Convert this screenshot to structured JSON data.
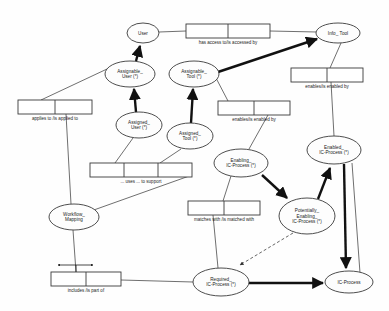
{
  "diagram": {
    "type": "entity-relationship-fact-diagram",
    "colors": {
      "stroke": "#3a3a3a",
      "thick_stroke": "#111111",
      "text": "#1a1a1a",
      "background": "#ffffff"
    },
    "entities": [
      {
        "id": "user",
        "label_lines": [
          "User"
        ],
        "cx": 143,
        "cy": 33,
        "rx": 16,
        "ry": 10
      },
      {
        "id": "info_tool",
        "label_lines": [
          "Info_ Tool"
        ],
        "cx": 338,
        "cy": 33,
        "rx": 22,
        "ry": 10
      },
      {
        "id": "assignable_user",
        "label_lines": [
          "Assignable_",
          "User (*)"
        ],
        "cx": 130,
        "cy": 74,
        "rx": 25,
        "ry": 13
      },
      {
        "id": "assignable_tool",
        "label_lines": [
          "Assignable_",
          "Tool (*)"
        ],
        "cx": 194,
        "cy": 74,
        "rx": 25,
        "ry": 13
      },
      {
        "id": "assigned_user",
        "label_lines": [
          "Assigned_",
          "User (*)"
        ],
        "cx": 139,
        "cy": 125,
        "rx": 23,
        "ry": 13
      },
      {
        "id": "assigned_tool",
        "label_lines": [
          "Assigned_",
          "Tool (*)"
        ],
        "cx": 190,
        "cy": 136,
        "rx": 23,
        "ry": 13
      },
      {
        "id": "enabled_icp",
        "label_lines": [
          "Enabled_",
          "IC-Process (*)"
        ],
        "cx": 334,
        "cy": 150,
        "rx": 27,
        "ry": 14
      },
      {
        "id": "enabling_icp",
        "label_lines": [
          "Enabling_",
          "IC-Process (*)"
        ],
        "cx": 241,
        "cy": 163,
        "rx": 27,
        "ry": 14
      },
      {
        "id": "potentially_icp",
        "label_lines": [
          "Potentially_",
          "Enabling_",
          "IC-Process (*)"
        ],
        "cx": 307,
        "cy": 216,
        "rx": 28,
        "ry": 18
      },
      {
        "id": "workflow",
        "label_lines": [
          "Workflow_",
          "Mapping"
        ],
        "cx": 74,
        "cy": 217,
        "rx": 25,
        "ry": 13
      },
      {
        "id": "required_icp",
        "label_lines": [
          "Required_",
          "IC-Process (*)"
        ],
        "cx": 221,
        "cy": 282,
        "rx": 28,
        "ry": 14
      },
      {
        "id": "ic_process",
        "label_lines": [
          "IC-Process"
        ],
        "cx": 349,
        "cy": 282,
        "rx": 24,
        "ry": 11
      }
    ],
    "fact_types": [
      {
        "id": "has_access_to",
        "label": "has access to/is accessed by",
        "x": 186,
        "y": 24,
        "w": 84,
        "h": 14,
        "roles": 2
      },
      {
        "id": "applies_to",
        "label": "applies to  /is applied to",
        "x": 18,
        "y": 100,
        "w": 74,
        "h": 14,
        "roles": 2
      },
      {
        "id": "enables_tool",
        "label": "enables/is enabled by",
        "x": 291,
        "y": 68,
        "w": 72,
        "h": 14,
        "roles": 2
      },
      {
        "id": "enables_mid",
        "label": "enables/is enabled by",
        "x": 218,
        "y": 101,
        "w": 72,
        "h": 14,
        "roles": 2
      },
      {
        "id": "uses_to_support",
        "label": "... uses ... to support",
        "x": 90,
        "y": 163,
        "w": 102,
        "h": 14,
        "roles": 3
      },
      {
        "id": "matches_with",
        "label": "matches with  /is matched with",
        "x": 188,
        "y": 201,
        "w": 72,
        "h": 14,
        "roles": 2
      },
      {
        "id": "includes",
        "label": "includes /is part of",
        "x": 51,
        "y": 272,
        "w": 70,
        "h": 14,
        "roles": 2
      }
    ]
  }
}
